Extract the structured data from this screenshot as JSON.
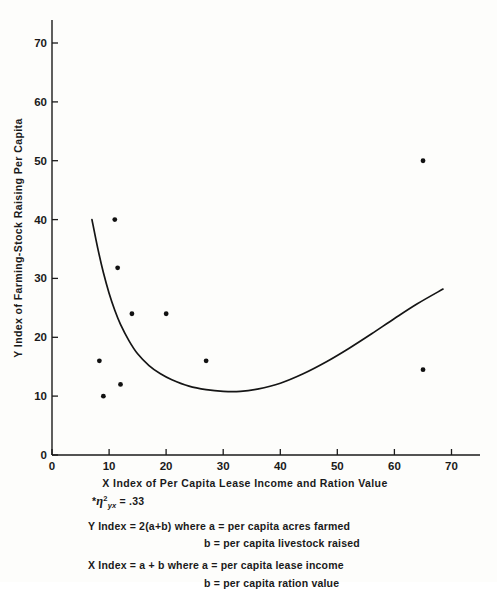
{
  "chart_data": {
    "type": "scatter",
    "title": "",
    "xlabel": "X Index of Per Capita Lease Income and Ration Value",
    "ylabel": "Y Index of Farming-Stock Raising Per Capita",
    "xlim": [
      0,
      75
    ],
    "ylim": [
      0,
      75
    ],
    "xticks": [
      0,
      10,
      20,
      30,
      40,
      50,
      60,
      70
    ],
    "yticks": [
      0,
      10,
      20,
      30,
      40,
      50,
      60,
      70
    ],
    "xtick_labels": [
      "0",
      "10",
      "20",
      "30",
      "40",
      "50",
      "60",
      "70"
    ],
    "ytick_labels": [
      "0",
      "10",
      "20",
      "30",
      "40",
      "50",
      "60",
      "70"
    ],
    "grid": false,
    "legend": false,
    "points": [
      {
        "x": 8.3,
        "y": 16.0
      },
      {
        "x": 9.0,
        "y": 10.0
      },
      {
        "x": 11.0,
        "y": 40.0
      },
      {
        "x": 11.5,
        "y": 31.8
      },
      {
        "x": 12.0,
        "y": 12.0
      },
      {
        "x": 14.0,
        "y": 24.0
      },
      {
        "x": 20.0,
        "y": 24.0
      },
      {
        "x": 27.0,
        "y": 16.0
      },
      {
        "x": 65.0,
        "y": 50.0
      },
      {
        "x": 65.0,
        "y": 14.5
      }
    ],
    "curve": {
      "name": "fitted curvilinear regression",
      "points": [
        {
          "x": 7.0,
          "y": 40.0
        },
        {
          "x": 8.0,
          "y": 35.2
        },
        {
          "x": 9.0,
          "y": 31.0
        },
        {
          "x": 10.0,
          "y": 27.5
        },
        {
          "x": 11.0,
          "y": 24.6
        },
        {
          "x": 12.0,
          "y": 22.2
        },
        {
          "x": 13.5,
          "y": 19.4
        },
        {
          "x": 15.0,
          "y": 17.2
        },
        {
          "x": 17.0,
          "y": 15.2
        },
        {
          "x": 19.0,
          "y": 13.8
        },
        {
          "x": 21.0,
          "y": 12.8
        },
        {
          "x": 24.0,
          "y": 11.7
        },
        {
          "x": 27.0,
          "y": 11.1
        },
        {
          "x": 30.0,
          "y": 10.8
        },
        {
          "x": 33.0,
          "y": 10.8
        },
        {
          "x": 36.0,
          "y": 11.2
        },
        {
          "x": 40.0,
          "y": 12.2
        },
        {
          "x": 44.0,
          "y": 13.8
        },
        {
          "x": 48.0,
          "y": 15.8
        },
        {
          "x": 52.0,
          "y": 18.1
        },
        {
          "x": 56.0,
          "y": 20.6
        },
        {
          "x": 60.0,
          "y": 23.2
        },
        {
          "x": 64.0,
          "y": 25.7
        },
        {
          "x": 68.5,
          "y": 28.2
        }
      ]
    },
    "annotations": {
      "eta_prefix": "*",
      "eta_symbol": "η",
      "eta_superscript": "2",
      "eta_subscript": "yx",
      "eta_equals": "= .33",
      "y_index_formula": "Y Index = 2(a+b) where a = per capita acres farmed",
      "y_index_formula_cont": "b = per capita livestock raised",
      "x_index_formula": "X Index = a + b where a = per capita lease income",
      "x_index_formula_cont": "b = per capita ration value"
    },
    "colors": {
      "point": "#111111",
      "curve": "#151515",
      "axis": "#1a1a1a",
      "background": "#fdfdfb"
    }
  }
}
